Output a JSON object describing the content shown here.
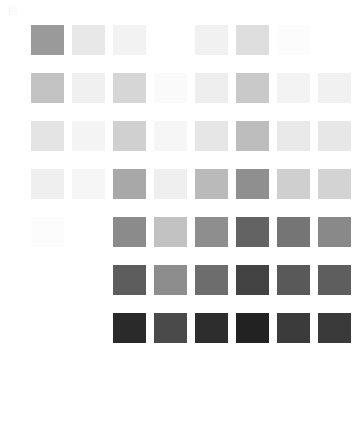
{
  "page": {
    "background": "#ffffff",
    "width": 362,
    "height": 425
  },
  "grid": {
    "columns": 8,
    "rows": 7,
    "swatch_width": 33,
    "swatch_height": 30,
    "column_gap": 8,
    "row_gap": 18,
    "origin_x": 31,
    "origin_y": 25,
    "column_x": [
      31,
      72,
      113,
      154,
      195,
      236,
      277,
      318
    ],
    "row_y": [
      25,
      73,
      121,
      169,
      217,
      265,
      313
    ]
  },
  "chart_data": {
    "type": "heatmap",
    "xlabel": "",
    "ylabel": "",
    "grid": false,
    "legend": "none",
    "columns": [
      "c1",
      "c2",
      "c3",
      "c4",
      "c5",
      "c6",
      "c7",
      "c8"
    ],
    "rows": [
      "r1",
      "r2",
      "r3",
      "r4",
      "r5",
      "r6",
      "r7"
    ],
    "colorscale": "grayscale",
    "cells": [
      [
        {
          "color": "#9a9a9a",
          "visible": true
        },
        {
          "color": "#e8e8e8",
          "visible": true
        },
        {
          "color": "#f2f2f2",
          "visible": true
        },
        {
          "color": "#ffffff",
          "visible": false
        },
        {
          "color": "#f1f1f1",
          "visible": true
        },
        {
          "color": "#dedede",
          "visible": true
        },
        {
          "color": "#fcfcfc",
          "visible": true
        },
        {
          "color": "#ffffff",
          "visible": false
        }
      ],
      [
        {
          "color": "#c3c3c3",
          "visible": true
        },
        {
          "color": "#f0f0f0",
          "visible": true
        },
        {
          "color": "#d6d6d6",
          "visible": true
        },
        {
          "color": "#fafafa",
          "visible": true
        },
        {
          "color": "#eeeeee",
          "visible": true
        },
        {
          "color": "#c9c9c9",
          "visible": true
        },
        {
          "color": "#f3f3f3",
          "visible": true
        },
        {
          "color": "#f1f1f1",
          "visible": true
        }
      ],
      [
        {
          "color": "#e4e4e4",
          "visible": true
        },
        {
          "color": "#f4f4f4",
          "visible": true
        },
        {
          "color": "#d0d0d0",
          "visible": true
        },
        {
          "color": "#f6f6f6",
          "visible": true
        },
        {
          "color": "#e6e6e6",
          "visible": true
        },
        {
          "color": "#bdbdbd",
          "visible": true
        },
        {
          "color": "#e9e9e9",
          "visible": true
        },
        {
          "color": "#e7e7e7",
          "visible": true
        }
      ],
      [
        {
          "color": "#efefef",
          "visible": true
        },
        {
          "color": "#f6f6f6",
          "visible": true
        },
        {
          "color": "#a8a8a8",
          "visible": true
        },
        {
          "color": "#efefef",
          "visible": true
        },
        {
          "color": "#bababa",
          "visible": true
        },
        {
          "color": "#8f8f8f",
          "visible": true
        },
        {
          "color": "#cfcfcf",
          "visible": true
        },
        {
          "color": "#d3d3d3",
          "visible": true
        }
      ],
      [
        {
          "color": "#fcfcfc",
          "visible": true
        },
        {
          "color": "#ffffff",
          "visible": false
        },
        {
          "color": "#8b8b8b",
          "visible": true
        },
        {
          "color": "#c2c2c2",
          "visible": true
        },
        {
          "color": "#8e8e8e",
          "visible": true
        },
        {
          "color": "#636363",
          "visible": true
        },
        {
          "color": "#757575",
          "visible": true
        },
        {
          "color": "#898989",
          "visible": true
        }
      ],
      [
        {
          "color": "#ffffff",
          "visible": false
        },
        {
          "color": "#ffffff",
          "visible": false
        },
        {
          "color": "#5d5d5d",
          "visible": true
        },
        {
          "color": "#8d8d8d",
          "visible": true
        },
        {
          "color": "#6d6d6d",
          "visible": true
        },
        {
          "color": "#434343",
          "visible": true
        },
        {
          "color": "#595959",
          "visible": true
        },
        {
          "color": "#5e5e5e",
          "visible": true
        }
      ],
      [
        {
          "color": "#ffffff",
          "visible": false
        },
        {
          "color": "#ffffff",
          "visible": false
        },
        {
          "color": "#2a2a2a",
          "visible": true
        },
        {
          "color": "#4a4a4a",
          "visible": true
        },
        {
          "color": "#2d2d2d",
          "visible": true
        },
        {
          "color": "#222222",
          "visible": true
        },
        {
          "color": "#3b3b3b",
          "visible": true
        },
        {
          "color": "#3a3a3a",
          "visible": true
        }
      ]
    ]
  },
  "artifacts": {
    "corner_mark": "faint-corner-mark"
  }
}
